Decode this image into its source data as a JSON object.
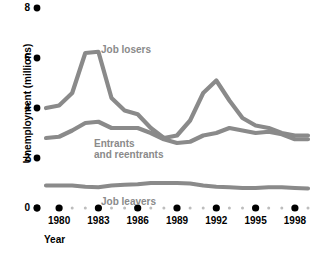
{
  "chart_data": {
    "type": "line",
    "title": "",
    "xlabel": "Year",
    "ylabel": "Unemployment (millions)",
    "xlim": [
      1979,
      1999
    ],
    "ylim": [
      0,
      8
    ],
    "grid": false,
    "legend_position": "inline-annotations",
    "y_ticks": [
      0,
      2,
      4,
      6,
      8
    ],
    "y_tick_labels": [
      "0",
      "2",
      "4",
      "6",
      "8"
    ],
    "x_ticks": [
      1980,
      1983,
      1986,
      1989,
      1992,
      1995,
      1998
    ],
    "x_tick_labels": [
      "1980",
      "1983",
      "1986",
      "1989",
      "1992",
      "1995",
      "1998"
    ],
    "x": [
      1979,
      1980,
      1981,
      1982,
      1983,
      1984,
      1985,
      1986,
      1987,
      1988,
      1989,
      1990,
      1991,
      1992,
      1993,
      1994,
      1995,
      1996,
      1997,
      1998,
      1999
    ],
    "series": [
      {
        "name": "Job losers",
        "color": "#8a8a8a",
        "values": [
          4.0,
          4.1,
          4.6,
          6.2,
          6.25,
          4.4,
          3.9,
          3.75,
          3.2,
          2.8,
          2.9,
          3.5,
          4.6,
          5.1,
          4.3,
          3.6,
          3.3,
          3.2,
          3.0,
          2.9,
          2.9
        ]
      },
      {
        "name": "Entrants and reentrants",
        "color": "#8a8a8a",
        "values": [
          2.8,
          2.85,
          3.1,
          3.4,
          3.45,
          3.2,
          3.2,
          3.2,
          3.0,
          2.75,
          2.6,
          2.65,
          2.9,
          3.0,
          3.2,
          3.1,
          3.0,
          3.05,
          2.95,
          2.75,
          2.75
        ]
      },
      {
        "name": "Job leavers",
        "color": "#8a8a8a",
        "values": [
          0.9,
          0.9,
          0.9,
          0.85,
          0.83,
          0.9,
          0.93,
          0.95,
          1.0,
          1.0,
          1.0,
          0.98,
          0.9,
          0.85,
          0.83,
          0.8,
          0.8,
          0.83,
          0.83,
          0.8,
          0.78
        ]
      }
    ],
    "annotations": [
      {
        "text": "Job losers",
        "x": 1985,
        "y": 6.3
      },
      {
        "text": "Entrants",
        "x": 1984,
        "y": 2.5
      },
      {
        "text": "and reentrants",
        "x": 1984,
        "y": 2.1
      },
      {
        "text": "Job leavers",
        "x": 1985,
        "y": 0.45
      }
    ]
  },
  "axes": {
    "y_title": "Unemployment (millions)",
    "x_title": "Year",
    "y_labels": [
      "8",
      "6",
      "4",
      "2",
      "0"
    ],
    "x_labels": [
      "1980",
      "1983",
      "1986",
      "1989",
      "1992",
      "1995",
      "1998"
    ]
  },
  "labels": {
    "job_losers": "Job losers",
    "entrants_line1": "Entrants",
    "entrants_line2": "and reentrants",
    "job_leavers": "Job leavers"
  },
  "colors": {
    "line": "#8a8a8a",
    "label": "#8a8a8a",
    "axis_text": "#000000",
    "tick_dot_major": "#000000",
    "tick_dot_minor": "#bdbdbd",
    "background": "#ffffff"
  }
}
